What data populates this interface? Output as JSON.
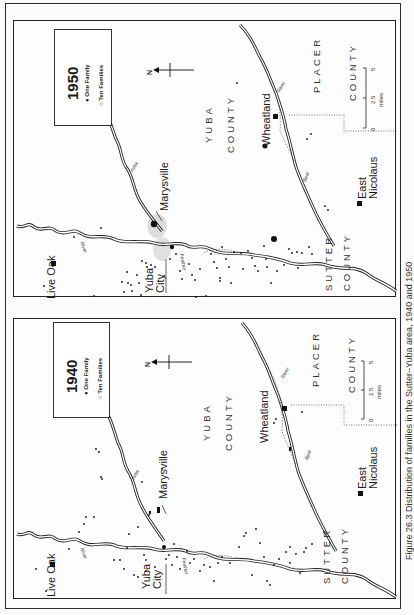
{
  "document": {
    "caption": "Figure 26.3   Distribution of families in the Sutter–Yuba area, 1940 and 1950",
    "orientation": "rotated -90°"
  },
  "maps": [
    {
      "id": "map-1950",
      "legend": {
        "year": "1950",
        "items": [
          {
            "symbol": "filled-dot",
            "label": "One Family"
          },
          {
            "symbol": "open-circle",
            "label": "Ten Families"
          }
        ]
      },
      "north_label": "N",
      "towns": {
        "live_oak": "Live Oak",
        "yuba_city_1": "Yuba",
        "yuba_city_2": "City",
        "marysville": "Marysville",
        "wheatland": "Wheatland",
        "east_nicolaus_1": "East",
        "east_nicolaus_2": "Nicolaus"
      },
      "counties": {
        "yuba_1": "YUBA",
        "yuba_2": "COUNTY",
        "sutter_1": "SUTTER",
        "sutter_2": "COUNTY",
        "placer_1": "PLACER",
        "placer_2": "COUNTY"
      },
      "rivers": {
        "feather_1": "Feather",
        "feather_2": "River",
        "yuba": "Yuba",
        "yuba_river": "River",
        "bear": "Bear",
        "bear_river": "River"
      },
      "scale": {
        "ticks": [
          "0",
          "2.5",
          "5"
        ],
        "unit": "miles"
      }
    },
    {
      "id": "map-1940",
      "legend": {
        "year": "1940",
        "items": [
          {
            "symbol": "filled-dot",
            "label": "One Family"
          },
          {
            "symbol": "open-circle",
            "label": "Ten Families"
          }
        ]
      },
      "north_label": "N",
      "towns": {
        "live_oak": "Live Oak",
        "yuba_city_1": "Yuba",
        "yuba_city_2": "City",
        "marysville": "Marysville",
        "wheatland": "Wheatland",
        "east_nicolaus_1": "East",
        "east_nicolaus_2": "Nicolaus"
      },
      "counties": {
        "yuba_1": "YUBA",
        "yuba_2": "COUNTY",
        "sutter_1": "SUTTER",
        "sutter_2": "COUNTY",
        "placer_1": "PLACER",
        "placer_2": "COUNTY"
      },
      "rivers": {
        "feather_1": "Feather",
        "feather_2": "River",
        "yuba": "Yuba",
        "yuba_river": "River",
        "bear": "Bear",
        "bear_river": "River"
      },
      "scale": {
        "ticks": [
          "0",
          "2.5",
          "5"
        ],
        "unit": "miles"
      }
    }
  ],
  "colors": {
    "ink": "#1a1a1a",
    "paper": "#fbfbfb",
    "urban_shade": "#d9d9d9"
  }
}
